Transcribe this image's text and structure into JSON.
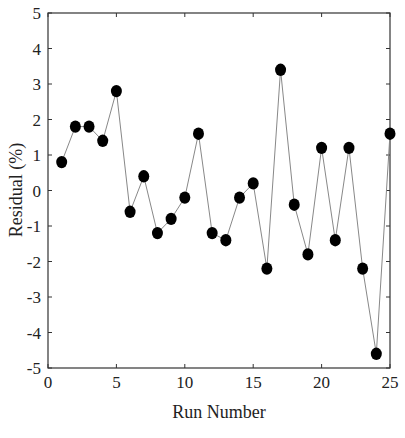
{
  "chart_data": {
    "type": "line",
    "title": "",
    "xlabel": "Run Number",
    "ylabel": "Residual (%)",
    "xlim": [
      0,
      25
    ],
    "ylim": [
      -5,
      5
    ],
    "x_ticks": [
      0,
      5,
      10,
      15,
      20,
      25
    ],
    "y_ticks": [
      5,
      4,
      3,
      2,
      1,
      0,
      -1,
      -2,
      -3,
      -4,
      -5
    ],
    "grid": false,
    "legend": null,
    "marker": "filled-circle",
    "series": [
      {
        "name": "Residual",
        "x": [
          1,
          2,
          3,
          4,
          5,
          6,
          7,
          8,
          9,
          10,
          11,
          12,
          13,
          14,
          15,
          16,
          17,
          18,
          19,
          20,
          21,
          22,
          23,
          24,
          25
        ],
        "values": [
          0.8,
          1.8,
          1.8,
          1.4,
          2.8,
          -0.6,
          0.4,
          -1.2,
          -0.8,
          -0.2,
          1.6,
          -1.2,
          -1.4,
          -0.2,
          0.2,
          -2.2,
          3.4,
          -0.4,
          -1.8,
          1.2,
          -1.4,
          1.2,
          -2.2,
          -4.6,
          1.6
        ]
      }
    ]
  },
  "colors": {
    "marker": "#000000",
    "line": "#888888",
    "axis": "#333333"
  }
}
